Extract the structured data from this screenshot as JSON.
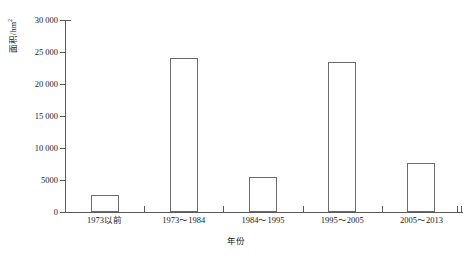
{
  "chart_data": {
    "type": "bar",
    "title": "",
    "xlabel": "年份",
    "ylabel": "面积/hm²",
    "ylabel_base": "面积/hm",
    "ylabel_sup": "2",
    "categories": [
      "1973以前",
      "1973～1984",
      "1984～1995",
      "1995～2005",
      "2005～2013"
    ],
    "values": [
      2700,
      24100,
      5500,
      23500,
      7600
    ],
    "ylim": [
      0,
      30000
    ],
    "ytick_values": [
      0,
      5000,
      10000,
      15000,
      20000,
      25000,
      30000
    ],
    "ytick_labels": [
      "0",
      "5000",
      "10 000",
      "15 000",
      "20 000",
      "25 000",
      "30 000"
    ],
    "grid": false,
    "legend": "none",
    "series": [
      {
        "name": "面积",
        "values": [
          2700,
          24100,
          5500,
          23500,
          7600
        ]
      }
    ],
    "bar_style": {
      "fill": "#ffffff",
      "edge": "#6b6b6b"
    },
    "axis_color": "#5a5a5a",
    "background": "#ffffff"
  }
}
